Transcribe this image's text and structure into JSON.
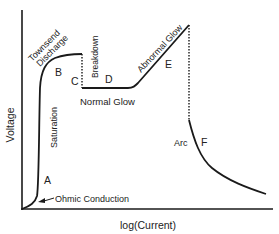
{
  "diagram": {
    "title": "",
    "axes": {
      "x_label": "log(Current)",
      "y_label": "Voltage"
    },
    "regions": [
      {
        "letter": "A",
        "name": "Ohmic Conduction"
      },
      {
        "letter": "B",
        "name": "Saturation"
      },
      {
        "letter": "C",
        "name": "Townsend Discharge"
      },
      {
        "letter": "D",
        "name": "Normal Glow"
      },
      {
        "letter": "E",
        "name": "Abnormal Glow"
      },
      {
        "letter": "F",
        "name": "Arc"
      }
    ],
    "annotations": {
      "townsend_line1": "Townsend",
      "townsend_line2": "Discharge",
      "breakdown": "Breakdown",
      "saturation": "Saturation",
      "normal_glow": "Normal Glow",
      "abnormal_glow": "Abnormal Glow",
      "arc": "Arc",
      "ohmic": "Ohmic Conduction"
    },
    "letters": {
      "a": "A",
      "b": "B",
      "c": "C",
      "d": "D",
      "e": "E",
      "f": "F"
    },
    "colors": {
      "line": "#1a1a1a",
      "text": "#222222",
      "background": "#ffffff"
    }
  }
}
